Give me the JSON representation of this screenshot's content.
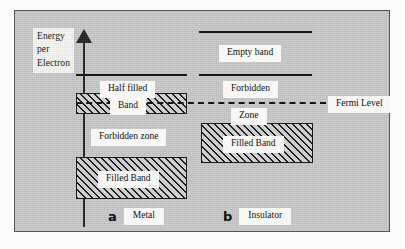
{
  "figure": {
    "axis": {
      "caption_lines": [
        "Energy",
        "per",
        "Electron"
      ],
      "arrow_icon": "up-arrow-icon",
      "direction": "up"
    },
    "fermi": {
      "label": "Fermi Level",
      "style": "dashed"
    },
    "panels": [
      {
        "id": "metal",
        "letter": "a",
        "name": "Metal",
        "bands": [
          {
            "id": "half-filled-band",
            "label_top": "Half filled",
            "label_bottom": "Band",
            "fill": "half",
            "hatched": true
          },
          {
            "id": "forbidden-zone",
            "label": "Forbidden zone",
            "fill": "none",
            "hatched": false
          },
          {
            "id": "filled-band",
            "label": "Filled Band",
            "fill": "full",
            "hatched": true
          }
        ]
      },
      {
        "id": "insulator",
        "letter": "b",
        "name": "Insulator",
        "bands": [
          {
            "id": "empty-band",
            "label": "Empty band",
            "fill": "none",
            "hatched": false
          },
          {
            "id": "forbidden-zone",
            "label_top": "Forbidden",
            "label_bottom": "Zone",
            "fill": "none",
            "hatched": false
          },
          {
            "id": "filled-band",
            "label": "Filled Band",
            "fill": "full",
            "hatched": true
          }
        ]
      }
    ],
    "colors": {
      "panel_background": "#c9c9c9",
      "ink": "#181818",
      "chip_background": "#f7f7f5",
      "page_background": "#fbfbfb"
    }
  }
}
